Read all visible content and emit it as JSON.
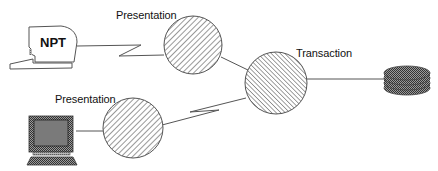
{
  "diagram": {
    "nodes": [
      {
        "id": "npt",
        "label": "NPT",
        "kind": "terminal"
      },
      {
        "id": "pc",
        "label": "",
        "kind": "personal-computer"
      },
      {
        "id": "presentation-top",
        "label": "Presentation",
        "kind": "process-circle"
      },
      {
        "id": "presentation-bottom",
        "label": "Presentation",
        "kind": "process-circle"
      },
      {
        "id": "transaction",
        "label": "Transaction",
        "kind": "process-circle"
      },
      {
        "id": "database",
        "label": "",
        "kind": "disk-stack"
      }
    ],
    "edges": [
      {
        "from": "npt",
        "to": "presentation-top",
        "style": "lightning"
      },
      {
        "from": "pc",
        "to": "presentation-bottom",
        "style": "line"
      },
      {
        "from": "presentation-top",
        "to": "transaction",
        "style": "line"
      },
      {
        "from": "presentation-bottom",
        "to": "transaction",
        "style": "lightning"
      },
      {
        "from": "transaction",
        "to": "database",
        "style": "line"
      }
    ]
  },
  "labels": {
    "npt": "NPT",
    "presentation_top": "Presentation",
    "presentation_bottom": "Presentation",
    "transaction": "Transaction"
  },
  "colors": {
    "stroke": "#555555",
    "hatch": "#444444",
    "dark_fill": "#444444",
    "screen_fill": "#7a7a7a"
  }
}
